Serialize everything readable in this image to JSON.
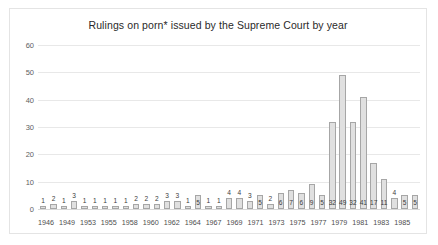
{
  "chart_data": {
    "type": "bar",
    "title": "Rulings on porn* issued by the Supreme Court by year",
    "xlabel": "",
    "ylabel": "",
    "ylim": [
      0,
      60
    ],
    "yticks": [
      0,
      10,
      20,
      30,
      40,
      50,
      60
    ],
    "grid": true,
    "legend": "none",
    "bar_color": "#e0e0e0",
    "bar_border_color": "#a6a6a6",
    "data_labels_shown": true,
    "categories": [
      "1946",
      "1947",
      "1949",
      "1951",
      "1953",
      "1954",
      "1955",
      "1957",
      "1958",
      "1959",
      "1960",
      "1961",
      "1962",
      "1963",
      "1964",
      "1966",
      "1967",
      "1968",
      "1969",
      "1970",
      "1971",
      "1972",
      "1973",
      "1974",
      "1975",
      "1976",
      "1977",
      "1978",
      "1979",
      "1980",
      "1981",
      "1982",
      "1983",
      "1984",
      "1985",
      "1986",
      "1987"
    ],
    "values": [
      1,
      2,
      1,
      3,
      1,
      1,
      1,
      1,
      1,
      2,
      2,
      2,
      3,
      3,
      1,
      5,
      1,
      1,
      4,
      4,
      3,
      5,
      2,
      6,
      7,
      6,
      9,
      5,
      32,
      49,
      32,
      41,
      17,
      11,
      4,
      5,
      5
    ],
    "xtick_labels": [
      "1946",
      "",
      "1949",
      "",
      "1953",
      "",
      "1955",
      "",
      "1958",
      "",
      "1960",
      "",
      "1962",
      "",
      "1964",
      "",
      "1967",
      "",
      "1969",
      "",
      "1971",
      "",
      "1973",
      "",
      "1975",
      "",
      "1977",
      "",
      "1979",
      "",
      "1981",
      "",
      "1983",
      "",
      "1985",
      "",
      ""
    ]
  }
}
